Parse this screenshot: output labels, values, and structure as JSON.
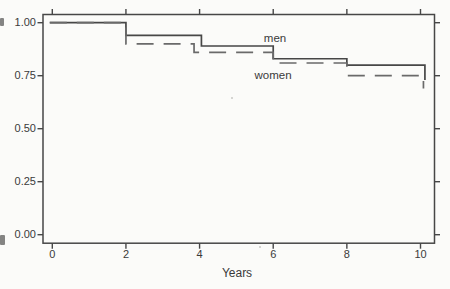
{
  "figure": {
    "background": "#fbfbf9",
    "ink_color": "#474747",
    "text_color": "#3a3a3a"
  },
  "chart_data": {
    "type": "line",
    "subtype": "step_survival_curve",
    "title": "",
    "xlabel": "Years",
    "ylabel": "",
    "xlim": [
      -0.25,
      10.4
    ],
    "ylim": [
      0.0,
      1.04
    ],
    "grid": false,
    "box": true,
    "legend_position": "inline-labels",
    "x_ticks": [
      {
        "label": "0",
        "value": 0
      },
      {
        "label": "2",
        "value": 2
      },
      {
        "label": "4",
        "value": 4
      },
      {
        "label": "6",
        "value": 6
      },
      {
        "label": "8",
        "value": 8
      },
      {
        "label": "10",
        "value": 10
      }
    ],
    "y_ticks": [
      {
        "label": "1.00",
        "value": 1.0
      },
      {
        "label": "0.75",
        "value": 0.75
      },
      {
        "label": "0.50",
        "value": 0.5
      },
      {
        "label": "0.25",
        "value": 0.25
      },
      {
        "label": "0.00",
        "value": 0.0
      }
    ],
    "series": [
      {
        "name": "men",
        "line_style": "solid",
        "color": "#474747",
        "steps": [
          [
            0,
            1.0
          ],
          [
            2,
            0.94
          ],
          [
            4.05,
            0.89
          ],
          [
            6,
            0.83
          ],
          [
            8,
            0.8
          ]
        ],
        "end": [
          10.12,
          0.73
        ]
      },
      {
        "name": "women",
        "line_style": "dashed",
        "color": "#6a6a6a",
        "steps": [
          [
            0,
            1.0
          ],
          [
            2,
            0.9
          ],
          [
            3.85,
            0.86
          ],
          [
            6,
            0.81
          ],
          [
            8,
            0.75
          ]
        ],
        "end": [
          10.08,
          0.69
        ]
      }
    ],
    "annotations": [
      {
        "text": "men",
        "anchor_px": [
          275,
          39
        ]
      },
      {
        "text": "women",
        "anchor_px": [
          273,
          76
        ]
      }
    ]
  }
}
